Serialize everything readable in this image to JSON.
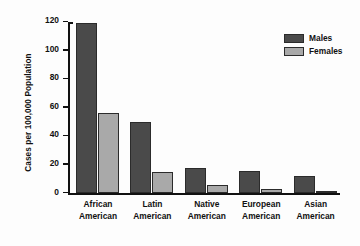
{
  "chart_data": {
    "type": "bar",
    "title": "",
    "xlabel": "",
    "ylabel": "Cases per 100,000 Population",
    "ylim": [
      0,
      120
    ],
    "yticks": [
      0,
      20,
      40,
      60,
      80,
      100,
      120
    ],
    "grid": false,
    "legend_position": "top-right",
    "categories": [
      "African American",
      "Latin American",
      "Native American",
      "European American",
      "Asian American"
    ],
    "category_lines": [
      [
        "African",
        "American"
      ],
      [
        "Latin",
        "American"
      ],
      [
        "Native",
        "American"
      ],
      [
        "European",
        "American"
      ],
      [
        "Asian",
        "American"
      ]
    ],
    "series": [
      {
        "name": "Males",
        "color": "#4a4a4a",
        "values": [
          119,
          50,
          18,
          16,
          12
        ]
      },
      {
        "name": "Females",
        "color": "#a9a9a9",
        "values": [
          56,
          15,
          6,
          3,
          2
        ]
      }
    ]
  },
  "legend": {
    "items": [
      {
        "label": "Males",
        "color": "#4a4a4a"
      },
      {
        "label": "Females",
        "color": "#a9a9a9"
      }
    ]
  },
  "axis": {
    "y_title": "Cases per 100,000 Population",
    "y_tick_labels": [
      "0",
      "20",
      "40",
      "60",
      "80",
      "100",
      "120"
    ]
  }
}
